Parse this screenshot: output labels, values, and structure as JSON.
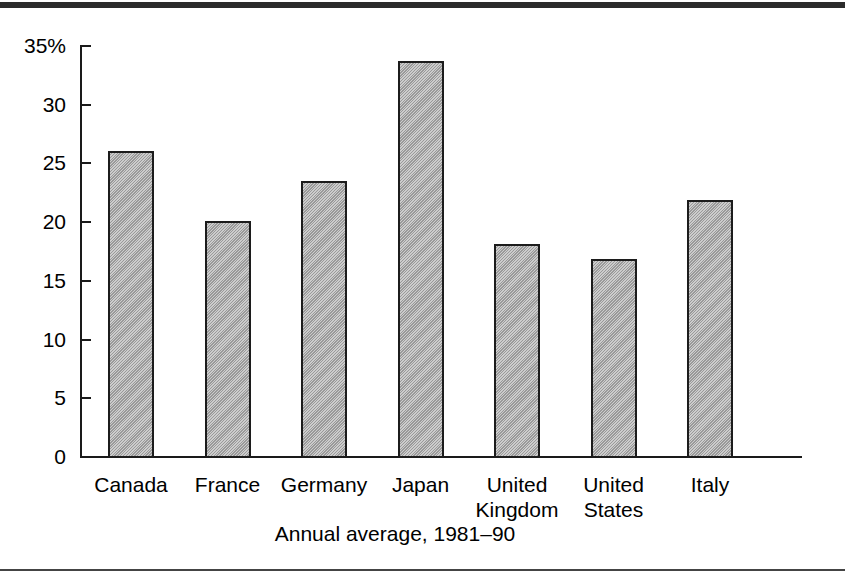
{
  "chart_data": {
    "type": "bar",
    "title": "",
    "subtitle": "Annual average, 1981–90",
    "xlabel": "",
    "ylabel": "",
    "categories": [
      "Canada",
      "France",
      "Germany",
      "Japan",
      "United Kingdom",
      "United States",
      "Italy"
    ],
    "category_lines": [
      [
        "Canada"
      ],
      [
        "France"
      ],
      [
        "Germany"
      ],
      [
        "Japan"
      ],
      [
        "United",
        "Kingdom"
      ],
      [
        "United",
        "States"
      ],
      [
        "Italy"
      ]
    ],
    "values": [
      26.1,
      20.1,
      23.5,
      33.7,
      18.1,
      16.9,
      21.9
    ],
    "ylim": [
      0,
      35
    ],
    "yticks": [
      0,
      5,
      10,
      15,
      20,
      25,
      30,
      35
    ],
    "ytick_labels": [
      "0",
      "5",
      "10",
      "15",
      "20",
      "25",
      "30",
      "35%"
    ],
    "unit": "%",
    "grid": false,
    "legend": null,
    "bar_fill_color": "#a8a8a8",
    "bar_edge_color": "#1c1c1c",
    "bar_pattern": "diagonal-hatch"
  },
  "figure": {
    "top_rule_color": "#2b2b2b",
    "bottom_rule_color": "#444444",
    "background": "#ffffff"
  }
}
